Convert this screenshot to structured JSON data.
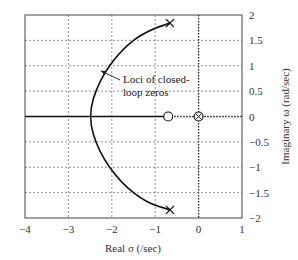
{
  "chart_data": {
    "type": "line",
    "title": "",
    "xlabel": "Real σ (/sec)",
    "ylabel": "Imaginary ω (rad/sec)",
    "xlim": [
      -4,
      1
    ],
    "ylim": [
      -2,
      2
    ],
    "x_ticks": [
      "−4",
      "−3",
      "−2",
      "−1",
      "0",
      "1"
    ],
    "y_ticks": [
      "2",
      "1.5",
      "1",
      "0.5",
      "0",
      "−0.5",
      "−1",
      "−1.5",
      "−2"
    ],
    "grid": true,
    "y_axis_position": "right",
    "annotation": {
      "line1": "Loci of closed-",
      "line2": "loop zeros",
      "points_to": [
        -2.3,
        0.9
      ]
    },
    "series": [
      {
        "name": "Loci of closed-loop zeros",
        "style": "solid",
        "points": [
          [
            -0.66,
            1.84
          ],
          [
            -1.2,
            1.7
          ],
          [
            -1.8,
            1.3
          ],
          [
            -2.3,
            0.7
          ],
          [
            -2.55,
            0.0
          ],
          [
            -2.3,
            -0.7
          ],
          [
            -1.8,
            -1.3
          ],
          [
            -1.2,
            -1.7
          ],
          [
            -0.66,
            -1.84
          ]
        ]
      },
      {
        "name": "Real-axis locus",
        "style": "solid",
        "points": [
          [
            -4,
            0
          ],
          [
            -0.7,
            0
          ]
        ]
      }
    ],
    "markers": [
      {
        "type": "x",
        "label": "pole",
        "x": -0.66,
        "y": 1.84
      },
      {
        "type": "x",
        "label": "pole",
        "x": -0.66,
        "y": -1.84
      },
      {
        "type": "o",
        "label": "zero",
        "x": -0.7,
        "y": 0
      },
      {
        "type": "circled-x",
        "label": "pole-zero",
        "x": 0,
        "y": 0
      }
    ]
  }
}
